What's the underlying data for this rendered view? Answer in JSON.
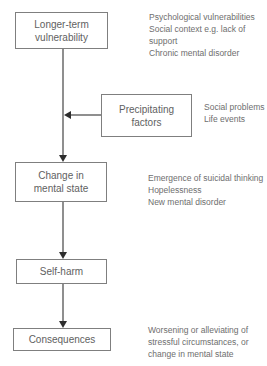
{
  "diagram": {
    "type": "flowchart",
    "colors": {
      "background": "#ffffff",
      "box_border": "#7f7f7f",
      "box_text": "#616161",
      "annotation_text": "#6e6e6e",
      "connector_line": "#8f8f8f",
      "arrowhead": "#2e2e2e"
    },
    "boxes": [
      {
        "id": "longer-term-vulnerability",
        "label": "Longer-term\nvulnerability"
      },
      {
        "id": "precipitating-factors",
        "label": "Precipitating\nfactors"
      },
      {
        "id": "change-in-mental-state",
        "label": "Change in\nmental state"
      },
      {
        "id": "self-harm",
        "label": "Self-harm"
      },
      {
        "id": "consequences",
        "label": "Consequences"
      }
    ],
    "annotations": [
      {
        "for": "longer-term-vulnerability",
        "lines": [
          "Psychological vulnerabilities",
          "Social context e.g. lack of",
          "support",
          "Chronic mental disorder"
        ]
      },
      {
        "for": "precipitating-factors",
        "lines": [
          "Social problems",
          "Life events"
        ]
      },
      {
        "for": "change-in-mental-state",
        "lines": [
          "Emergence of suicidal thinking",
          "Hopelessness",
          "New mental disorder"
        ]
      },
      {
        "for": "consequences",
        "lines": [
          "Worsening or alleviating of",
          "stressful circumstances, or",
          "change in mental state"
        ]
      }
    ],
    "connections": [
      {
        "from": "longer-term-vulnerability",
        "to": "change-in-mental-state",
        "direction": "down"
      },
      {
        "from": "precipitating-factors",
        "to": "main-flow-line",
        "direction": "left"
      },
      {
        "from": "change-in-mental-state",
        "to": "self-harm",
        "direction": "down"
      },
      {
        "from": "self-harm",
        "to": "consequences",
        "direction": "down"
      }
    ]
  }
}
